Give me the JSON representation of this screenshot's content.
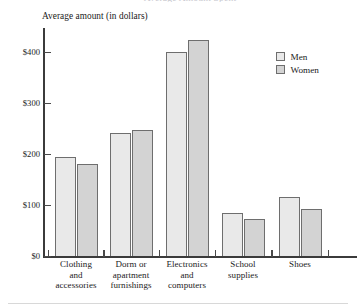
{
  "chart_data": {
    "type": "bar",
    "title": "",
    "xlabel": "",
    "ylabel": "Average amount (in dollars)",
    "ylim": [
      0,
      450
    ],
    "grid": false,
    "legend_position": "top-right",
    "categories": [
      "Clothing\nand\naccessories",
      "Dorm or\napartment\nfurnishings",
      "Electronics\nand\ncomputers",
      "School\nsupplies",
      "Shoes"
    ],
    "ytick_labels": [
      "$0",
      "$100",
      "$200",
      "$300",
      "$400"
    ],
    "ytick_values": [
      0,
      100,
      200,
      300,
      400
    ],
    "series": [
      {
        "name": "Men",
        "color": "#e9e9e9",
        "values": [
          194,
          241,
          400,
          84,
          115
        ]
      },
      {
        "name": "Women",
        "color": "#d3d3d3",
        "values": [
          180,
          248,
          424,
          73,
          93
        ]
      }
    ]
  },
  "legend": {
    "items": [
      {
        "label": "Men"
      },
      {
        "label": "Women"
      }
    ]
  },
  "axis": {
    "y_title": "Average amount (in dollars)"
  },
  "header": {
    "cropped_title": "Average Amount Spent"
  },
  "colors": {
    "men_fill": "#e9e9e9",
    "women_fill": "#d3d3d3",
    "bar_stroke": "#6e6e6e",
    "axis": "#3b3b3b",
    "text": "#1a1a1a"
  }
}
